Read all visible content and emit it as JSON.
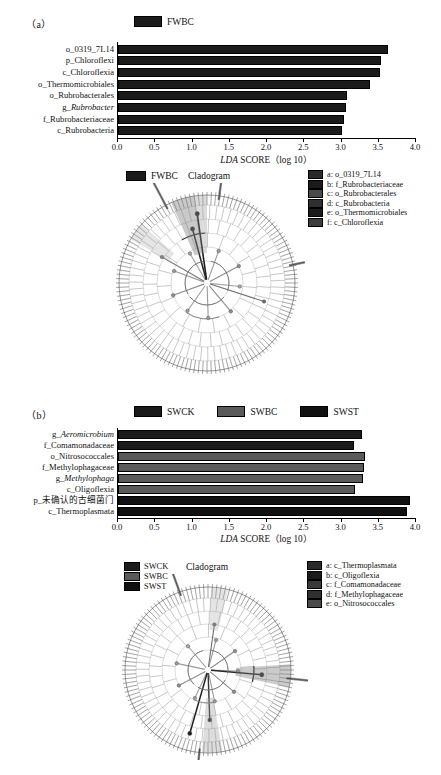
{
  "panel_a": {
    "tag": "（a）",
    "bar_legend": [
      {
        "label": "FWBC",
        "color": "#1b1b1b"
      }
    ],
    "cladogram": {
      "title": "Cladogram",
      "group_legend": [
        {
          "label": "FWBC",
          "color": "#1b1b1b"
        }
      ],
      "key_legend": [
        {
          "label": "a: o_0319_7L14",
          "color": "#2a2a2a"
        },
        {
          "label": "b: f_Rubrobacteriaceae",
          "color": "#1b1b1b"
        },
        {
          "label": "c: o_Rubrobacterales",
          "color": "#4a4a4a"
        },
        {
          "label": "d: c_Rubrobacteria",
          "color": "#2f2f2f"
        },
        {
          "label": "e: o_Thermomicrobiales",
          "color": "#1b1b1b"
        },
        {
          "label": "f: c_Chloroflexia",
          "color": "#3d3d3d"
        }
      ],
      "ray_labels": [
        "a_Chloroflexi",
        "f_Rubrobacteriaceae"
      ]
    }
  },
  "panel_b": {
    "tag": "（b）",
    "bar_legend": [
      {
        "label": "SWCK",
        "color": "#1b1b1b"
      },
      {
        "label": "SWBC",
        "color": "#5a5a5a"
      },
      {
        "label": "SWST",
        "color": "#111111"
      }
    ],
    "cladogram": {
      "title": "Cladogram",
      "group_legend": [
        {
          "label": "SWCK",
          "color": "#1b1b1b"
        },
        {
          "label": "SWBC",
          "color": "#5a5a5a"
        },
        {
          "label": "SWST",
          "color": "#111111"
        }
      ],
      "key_legend": [
        {
          "label": "a: c_Thermoplasmata",
          "color": "#2a2a2a"
        },
        {
          "label": "b: c_Oligoflexia",
          "color": "#1b1b1b"
        },
        {
          "label": "c: f_Comamonadaceae",
          "color": "#3a3a3a"
        },
        {
          "label": "d: f_Methylophagaceae",
          "color": "#2f2f2f"
        },
        {
          "label": "e: o_Nitrosococcales",
          "color": "#4a4a4a"
        }
      ],
      "ray_labels": [
        "c_Thermoplasmata",
        "o_Nitrosococcales"
      ]
    }
  },
  "chart_data": [
    {
      "type": "bar",
      "panel": "a",
      "orientation": "horizontal",
      "title": "",
      "xlabel": "LDA SCORE (log 10)",
      "ylabel": "",
      "xlim": [
        0.0,
        4.0
      ],
      "xticks": [
        "0.0",
        "0.5",
        "1.0",
        "1.5",
        "2.0",
        "2.5",
        "3.0",
        "3.5",
        "4.0"
      ],
      "xtick_values": [
        0.0,
        0.5,
        1.0,
        1.5,
        2.0,
        2.5,
        3.0,
        3.5,
        4.0
      ],
      "grid": false,
      "legend_position": "top",
      "categories": [
        "o_0319_7L14",
        "p_Chloroflexi",
        "c_Chloroflexia",
        "o_Thermomicrobiales",
        "o_Rubrobacterales",
        "g_Rubrobacter",
        "f_Rubrobacteriaceae",
        "c_Rubrobacteria"
      ],
      "categories_italic": [
        false,
        false,
        false,
        false,
        false,
        true,
        false,
        false
      ],
      "series": [
        {
          "name": "FWBC",
          "color": "#1b1b1b",
          "values": [
            3.62,
            3.53,
            3.52,
            3.38,
            3.08,
            3.06,
            3.04,
            3.01
          ]
        }
      ]
    },
    {
      "type": "bar",
      "panel": "b",
      "orientation": "horizontal",
      "title": "",
      "xlabel": "LDA SCORE (log 10)",
      "ylabel": "",
      "xlim": [
        0.0,
        4.0
      ],
      "xticks": [
        "0.0",
        "0.5",
        "1.0",
        "1.5",
        "2.0",
        "2.5",
        "3.0",
        "3.5",
        "4.0"
      ],
      "xtick_values": [
        0.0,
        0.5,
        1.0,
        1.5,
        2.0,
        2.5,
        3.0,
        3.5,
        4.0
      ],
      "grid": false,
      "legend_position": "top",
      "categories": [
        "g_Aeromicrobium",
        "f_Comamonadaceae",
        "o_Nitrosococcales",
        "f_Methylophagaceae",
        "g_Methylophaga",
        "c_Oligoflexia",
        "p_未确认的古细菌门",
        "c_Thermoplasmata"
      ],
      "categories_italic": [
        true,
        false,
        false,
        false,
        true,
        false,
        false,
        false
      ],
      "bars": [
        {
          "category": "g_Aeromicrobium",
          "group": "SWCK",
          "value": 3.27,
          "color": "#1b1b1b"
        },
        {
          "category": "f_Comamonadaceae",
          "group": "SWCK",
          "value": 3.17,
          "color": "#1b1b1b"
        },
        {
          "category": "o_Nitrosococcales",
          "group": "SWBC",
          "value": 3.32,
          "color": "#5a5a5a"
        },
        {
          "category": "f_Methylophagaceae",
          "group": "SWBC",
          "value": 3.3,
          "color": "#5a5a5a"
        },
        {
          "category": "g_Methylophaga",
          "group": "SWBC",
          "value": 3.29,
          "color": "#5a5a5a"
        },
        {
          "category": "c_Oligoflexia",
          "group": "SWBC",
          "value": 3.18,
          "color": "#5a5a5a"
        },
        {
          "category": "p_未确认的古细菌门",
          "group": "SWST",
          "value": 3.92,
          "color": "#111111"
        },
        {
          "category": "c_Thermoplasmata",
          "group": "SWST",
          "value": 3.88,
          "color": "#111111"
        }
      ]
    }
  ]
}
